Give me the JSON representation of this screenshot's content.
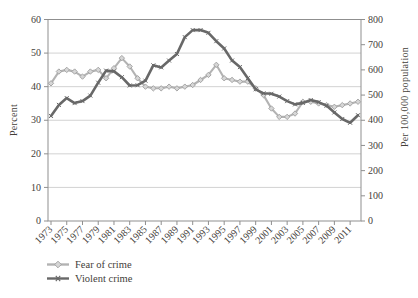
{
  "figure_kind": "line chart, two series, dual y-axes, no title",
  "chart_data": {
    "type": "line",
    "title": "",
    "x": [
      1973,
      1974,
      1975,
      1976,
      1977,
      1978,
      1979,
      1980,
      1981,
      1982,
      1983,
      1984,
      1985,
      1986,
      1987,
      1988,
      1989,
      1990,
      1991,
      1992,
      1993,
      1994,
      1995,
      1996,
      1997,
      1998,
      1999,
      2000,
      2001,
      2002,
      2003,
      2004,
      2005,
      2006,
      2007,
      2008,
      2009,
      2010,
      2011,
      2012
    ],
    "series": [
      {
        "name": "Fear of crime",
        "axis": "left",
        "unit": "percent",
        "marker": "diamond",
        "values": [
          41,
          44.5,
          45,
          44.5,
          43,
          44.5,
          45,
          42.5,
          45.5,
          48.5,
          46,
          42.5,
          40,
          39.5,
          39.5,
          40,
          39.5,
          40,
          40.5,
          42,
          43.5,
          46.5,
          42.5,
          42,
          41.5,
          41.5,
          39.5,
          37.5,
          33.5,
          31,
          31,
          32,
          35.5,
          35.5,
          35,
          34.5,
          34,
          34.5,
          35,
          35.5
        ]
      },
      {
        "name": "Violent crime",
        "axis": "right",
        "unit": "per 100,000 population",
        "marker": "x",
        "values": [
          417,
          461,
          488,
          468,
          476,
          498,
          549,
          597,
          594,
          571,
          538,
          539,
          557,
          618,
          610,
          637,
          663,
          730,
          758,
          758,
          747,
          714,
          685,
          637,
          611,
          567,
          523,
          507,
          505,
          494,
          476,
          463,
          469,
          480,
          472,
          458,
          431,
          405,
          390,
          420
        ]
      }
    ],
    "left_axis": {
      "label": "Percent",
      "min": 0,
      "max": 60,
      "ticks": [
        0,
        10,
        20,
        30,
        40,
        50,
        60
      ]
    },
    "right_axis": {
      "label": "Per 100,000 population",
      "min": 0,
      "max": 800,
      "ticks": [
        0,
        100,
        200,
        300,
        400,
        500,
        600,
        700,
        800
      ]
    },
    "x_axis": {
      "tick_years": [
        1973,
        1975,
        1977,
        1979,
        1981,
        1983,
        1985,
        1987,
        1989,
        1991,
        1993,
        1995,
        1997,
        1999,
        2001,
        2003,
        2005,
        2007,
        2009,
        2011
      ],
      "label_rotation_deg": -45
    },
    "grid": "horizontal only, at left-axis steps 10-50, top border doubles as 60/800 line",
    "legend_position": "bottom-left"
  },
  "colors": {
    "fear_line": "#b3b3b3",
    "fear_marker_fill": "#d6d6d6",
    "fear_marker_stroke": "#9e9e9e",
    "violent_line": "#686868",
    "grid": "#cdcdcd",
    "axis": "#8f8f8f",
    "text": "#44403a",
    "background": "#ffffff"
  }
}
